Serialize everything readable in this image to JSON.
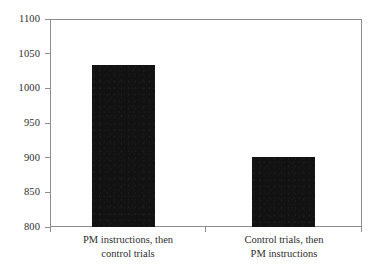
{
  "chart_data": {
    "type": "bar",
    "title": "",
    "xlabel": "",
    "ylabel": "",
    "categories": [
      "PM instructions, then control trials",
      "Control trials, then PM instructions"
    ],
    "category_lines": [
      [
        "PM instructions, then",
        "control trials"
      ],
      [
        "Control trials, then",
        "PM instructions"
      ]
    ],
    "values": [
      1033,
      901
    ],
    "ylim": [
      800,
      1100
    ],
    "ytick_step": 50,
    "yticks": [
      800,
      850,
      900,
      950,
      1000,
      1050,
      1100
    ],
    "ytick_labels": [
      "800",
      "850",
      "900",
      "950",
      "1000",
      "1050",
      "1100"
    ],
    "xticks": [
      "",
      "",
      ""
    ],
    "grid": false,
    "legend": false,
    "legend_position": "none",
    "bar_color": "#121212",
    "frame_color": "#8d8d8d",
    "text_color": "#2e2e2e",
    "background_color": "#ffffff"
  }
}
